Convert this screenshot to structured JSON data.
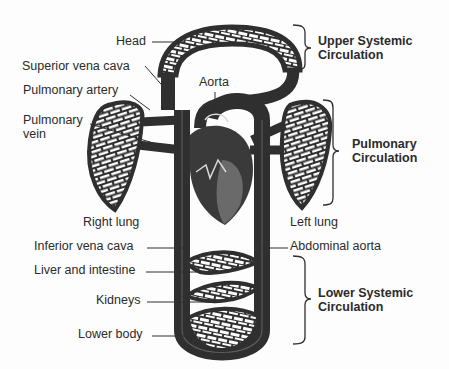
{
  "diagram": {
    "colors": {
      "vessel": "#2f2f2f",
      "heart_dark": "#3a3a3a",
      "heart_mid": "#6a6a6a",
      "background": "#fdfdfd",
      "text": "#2b2b2b"
    },
    "labels": {
      "head": "Head",
      "superior_vena_cava": "Superior vena cava",
      "pulmonary_artery": "Pulmonary artery",
      "pulmonary_vein_1": "Pulmonary",
      "pulmonary_vein_2": "vein",
      "aorta": "Aorta",
      "right_lung": "Right lung",
      "left_lung": "Left lung",
      "inferior_vena_cava": "Inferior vena cava",
      "abdominal_aorta": "Abdominal aorta",
      "liver_and_intestine": "Liver and intestine",
      "kidneys": "Kidneys",
      "lower_body": "Lower body"
    },
    "groups": {
      "upper_systemic_1": "Upper Systemic",
      "upper_systemic_2": "Circulation",
      "pulmonary_1": "Pulmonary",
      "pulmonary_2": "Circulation",
      "lower_systemic_1": "Lower Systemic",
      "lower_systemic_2": "Circulation"
    }
  }
}
